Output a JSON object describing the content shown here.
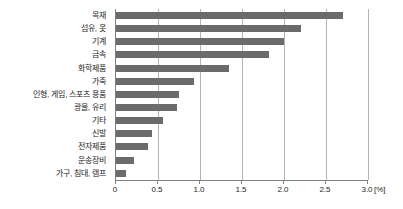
{
  "chart_data": {
    "type": "bar",
    "orientation": "horizontal",
    "title": "",
    "subtitle": "",
    "xlabel": "",
    "ylabel": "",
    "unit_label": "[%]",
    "xlim": [
      0,
      3.0
    ],
    "grid": true,
    "legend": "none",
    "bar_color": "#6b6b6b",
    "axis_color": "#808080",
    "gridline_color": "#b4b4b4",
    "text_color": "#1d1d1d",
    "categories": [
      "목재",
      "섬유, 옷",
      "기계",
      "금속",
      "화학제품",
      "가죽",
      "인형, 게임, 스포츠 용품",
      "광물, 유리",
      "기타",
      "신발",
      "전자제품",
      "운송장비",
      "가구, 침대, 램프"
    ],
    "values": [
      2.7,
      2.2,
      2.0,
      1.82,
      1.34,
      0.93,
      0.75,
      0.73,
      0.56,
      0.43,
      0.38,
      0.22,
      0.12
    ],
    "xticks": [
      0,
      0.5,
      1.0,
      1.5,
      2.0,
      2.5,
      3.0
    ],
    "xticklabels": [
      "0",
      "0.5",
      "1.0",
      "1.5",
      "2.0",
      "2.5",
      "3.0"
    ]
  }
}
